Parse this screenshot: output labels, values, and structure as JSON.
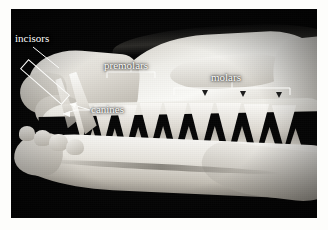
{
  "figure": {
    "background_color": "#ffffff",
    "plate_color": "#050505",
    "annotation_color": "#fcfcfa"
  },
  "labels": {
    "incisors": "incisors",
    "premolars": "premolars",
    "canines": "canines",
    "molars": "molars"
  },
  "annotations": [
    {
      "name": "incisors",
      "text": "incisors",
      "marker": "rotated-bracket",
      "leader": "diagonal-line-down-right"
    },
    {
      "name": "premolars",
      "text": "premolars",
      "marker": "square-bracket-below",
      "leader": "center-tick"
    },
    {
      "name": "canines",
      "text": "canines",
      "marker": "forked-arrow-left",
      "leader": "two-pronged"
    },
    {
      "name": "molars",
      "text": "molars",
      "marker": "square-bracket-below",
      "leader": "center-tick-with-cusp-arrowheads"
    }
  ],
  "specimen": {
    "view": "lateral-left-profile",
    "parts": [
      "cranium",
      "rostrum",
      "upper-tooth-row",
      "mandible",
      "lower-tooth-row"
    ]
  }
}
